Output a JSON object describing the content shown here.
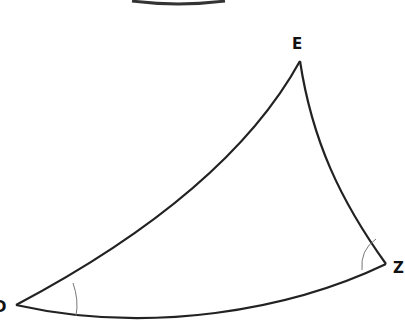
{
  "diagram": {
    "type": "curved-triangle",
    "vertices": [
      {
        "name": "E",
        "label": "E",
        "x": 300,
        "y": 61
      },
      {
        "name": "Z",
        "label": "Z",
        "x": 386,
        "y": 264
      },
      {
        "name": "D",
        "label": "D",
        "x": 16,
        "y": 305
      }
    ],
    "edges": [
      {
        "from": "D",
        "to": "E",
        "shape": "concave curve"
      },
      {
        "from": "E",
        "to": "Z",
        "shape": "slightly convex curve"
      },
      {
        "from": "Z",
        "to": "D",
        "shape": "convex curve"
      }
    ],
    "angle_marks": [
      "D",
      "Z"
    ],
    "colors": {
      "stroke": "#222222",
      "angle_mark": "#777777",
      "label": "#111111"
    }
  }
}
